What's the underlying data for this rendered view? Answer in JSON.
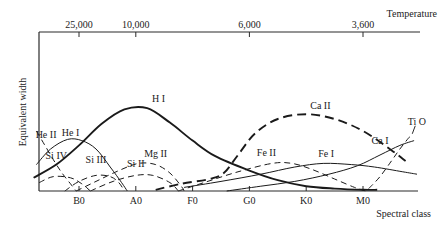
{
  "chart_data": {
    "type": "line",
    "title": "",
    "xlabel": "Spectral class",
    "ylabel": "Equivalent width",
    "top_axis_label": "Temperature",
    "x_categories": [
      "B0",
      "A0",
      "F0",
      "G0",
      "K0",
      "M0"
    ],
    "x_category_positions": [
      1,
      2,
      3,
      4,
      5,
      6
    ],
    "x_range": [
      0.2,
      7.15
    ],
    "top_ticks": [
      {
        "label": "25,000",
        "x": 1.0
      },
      {
        "label": "10,000",
        "x": 2.0
      },
      {
        "label": "6,000",
        "x": 4.0
      },
      {
        "label": "3,600",
        "x": 6.0
      }
    ],
    "y_range": [
      0,
      1
    ],
    "y_ticks_shown": false,
    "grid": false,
    "legend": "none (inline labels)",
    "series": [
      {
        "name": "H I",
        "style": "solid-thick",
        "label_at": {
          "x": 2.4,
          "y": 0.74
        },
        "points": [
          [
            0.2,
            0.11
          ],
          [
            0.6,
            0.22
          ],
          [
            1.0,
            0.38
          ],
          [
            1.4,
            0.56
          ],
          [
            1.8,
            0.68
          ],
          [
            2.2,
            0.69
          ],
          [
            2.6,
            0.57
          ],
          [
            3.0,
            0.42
          ],
          [
            3.4,
            0.29
          ],
          [
            4.0,
            0.17
          ],
          [
            4.5,
            0.09
          ],
          [
            5.0,
            0.04
          ],
          [
            5.5,
            0.02
          ],
          [
            6.0,
            0.01
          ],
          [
            6.25,
            0.01
          ]
        ]
      },
      {
        "name": "He I",
        "style": "solid",
        "label_at": {
          "x": 0.85,
          "y": 0.46
        },
        "points": [
          [
            0.25,
            0.22
          ],
          [
            0.5,
            0.35
          ],
          [
            0.8,
            0.43
          ],
          [
            1.05,
            0.42
          ],
          [
            1.3,
            0.35
          ],
          [
            1.55,
            0.2
          ],
          [
            1.75,
            0.07
          ],
          [
            1.85,
            0.0
          ]
        ]
      },
      {
        "name": "He II",
        "style": "dashed",
        "label_at": {
          "x": 0.42,
          "y": 0.44
        },
        "points": [
          [
            0.25,
            0.5
          ],
          [
            0.4,
            0.38
          ],
          [
            0.55,
            0.26
          ],
          [
            0.7,
            0.15
          ],
          [
            0.85,
            0.06
          ],
          [
            0.95,
            0.0
          ]
        ]
      },
      {
        "name": "Si IV",
        "style": "dashed",
        "label_at": {
          "x": 0.6,
          "y": 0.27
        },
        "points": [
          [
            0.3,
            0.07
          ],
          [
            0.55,
            0.12
          ],
          [
            0.85,
            0.11
          ],
          [
            1.05,
            0.06
          ],
          [
            1.2,
            0.0
          ]
        ]
      },
      {
        "name": "Si III",
        "style": "dashed",
        "label_at": {
          "x": 1.3,
          "y": 0.23
        },
        "points": [
          [
            0.75,
            0.0
          ],
          [
            1.0,
            0.08
          ],
          [
            1.3,
            0.13
          ],
          [
            1.55,
            0.12
          ],
          [
            1.7,
            0.07
          ],
          [
            1.8,
            0.0
          ]
        ]
      },
      {
        "name": "Mg II",
        "style": "dashed",
        "label_at": {
          "x": 2.35,
          "y": 0.28
        },
        "points": [
          [
            0.95,
            0.0
          ],
          [
            1.3,
            0.08
          ],
          [
            1.7,
            0.17
          ],
          [
            2.05,
            0.23
          ],
          [
            2.35,
            0.22
          ],
          [
            2.6,
            0.15
          ],
          [
            2.8,
            0.04
          ],
          [
            2.85,
            0.0
          ]
        ]
      },
      {
        "name": "Si II",
        "style": "dashed",
        "label_at": {
          "x": 2.0,
          "y": 0.2
        },
        "points": [
          [
            1.2,
            0.0
          ],
          [
            1.6,
            0.08
          ],
          [
            2.0,
            0.13
          ],
          [
            2.3,
            0.13
          ],
          [
            2.6,
            0.07
          ],
          [
            2.75,
            0.0
          ]
        ]
      },
      {
        "name": "Ca II",
        "style": "dashed-thick",
        "label_at": {
          "x": 5.25,
          "y": 0.68
        },
        "points": [
          [
            2.35,
            0.01
          ],
          [
            2.8,
            0.06
          ],
          [
            3.3,
            0.1
          ],
          [
            3.55,
            0.15
          ],
          [
            3.8,
            0.3
          ],
          [
            4.1,
            0.48
          ],
          [
            4.5,
            0.6
          ],
          [
            5.0,
            0.64
          ],
          [
            5.5,
            0.6
          ],
          [
            6.0,
            0.5
          ],
          [
            6.5,
            0.34
          ],
          [
            6.75,
            0.25
          ]
        ]
      },
      {
        "name": "Fe II",
        "style": "dashed",
        "label_at": {
          "x": 4.3,
          "y": 0.29
        },
        "points": [
          [
            2.75,
            0.0
          ],
          [
            3.2,
            0.07
          ],
          [
            3.8,
            0.16
          ],
          [
            4.4,
            0.23
          ],
          [
            4.75,
            0.23
          ],
          [
            5.1,
            0.18
          ],
          [
            5.5,
            0.1
          ],
          [
            5.85,
            0.03
          ],
          [
            6.05,
            0.0
          ]
        ]
      },
      {
        "name": "Fe I",
        "style": "solid",
        "label_at": {
          "x": 5.35,
          "y": 0.28
        },
        "points": [
          [
            2.85,
            0.03
          ],
          [
            3.5,
            0.08
          ],
          [
            4.2,
            0.14
          ],
          [
            4.8,
            0.2
          ],
          [
            5.3,
            0.23
          ],
          [
            5.8,
            0.22
          ],
          [
            6.2,
            0.2
          ],
          [
            6.7,
            0.16
          ],
          [
            6.95,
            0.14
          ]
        ]
      },
      {
        "name": "Ca I",
        "style": "solid",
        "label_at": {
          "x": 6.3,
          "y": 0.39
        },
        "points": [
          [
            3.6,
            0.0
          ],
          [
            4.2,
            0.04
          ],
          [
            4.8,
            0.08
          ],
          [
            5.4,
            0.14
          ],
          [
            5.9,
            0.21
          ],
          [
            6.3,
            0.3
          ],
          [
            6.65,
            0.38
          ],
          [
            6.9,
            0.42
          ]
        ]
      },
      {
        "name": "Ti O",
        "style": "dashed",
        "label_at": {
          "x": 6.95,
          "y": 0.55
        },
        "points": [
          [
            6.1,
            0.02
          ],
          [
            6.3,
            0.12
          ],
          [
            6.5,
            0.25
          ],
          [
            6.65,
            0.35
          ],
          [
            6.8,
            0.44
          ],
          [
            6.85,
            0.46
          ]
        ]
      }
    ]
  }
}
